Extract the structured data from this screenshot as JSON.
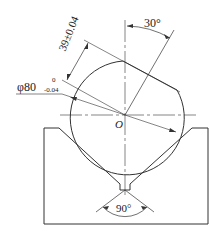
{
  "figure": {
    "type": "engineering-drawing",
    "labels": {
      "angle_top": "30°",
      "angle_bottom": "90°",
      "center": "O",
      "diameter": "φ80",
      "diameter_upper_tol": "0",
      "diameter_lower_tol": "-0.04",
      "flat_distance": "39±0.04"
    },
    "colors": {
      "line": "#333333",
      "background": "#ffffff"
    }
  }
}
